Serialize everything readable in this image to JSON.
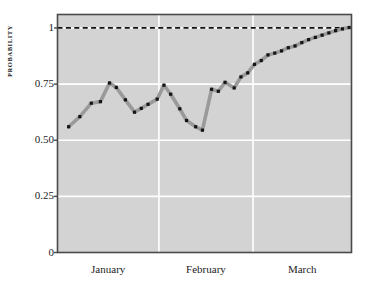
{
  "chart_data": {
    "type": "line",
    "title": "",
    "xlabel": "",
    "ylabel": "PROBABILITY",
    "ylim": [
      0,
      1.06
    ],
    "yticks": [
      0,
      0.25,
      0.5,
      0.75,
      1
    ],
    "ytick_labels": [
      "0",
      "0.25",
      "0.50",
      "0.75",
      "1"
    ],
    "xtick_labels": [
      "January",
      "February",
      "March"
    ],
    "grid": true,
    "grid_color": "#ffffff",
    "plot_bg": "#d3d3d3",
    "page_bg": "#ffffff",
    "line_color": "#9a9a9a",
    "marker_color": "#141414",
    "axis_color": "#4a4a4a",
    "legend": "none",
    "annotations": [
      {
        "type": "hline",
        "y": 1,
        "style": "dashed",
        "color": "#111111",
        "label": ""
      }
    ],
    "month_boundaries": [
      0.345,
      0.665
    ],
    "x": [
      0.038,
      0.076,
      0.115,
      0.146,
      0.177,
      0.2,
      0.231,
      0.262,
      0.285,
      0.308,
      0.339,
      0.362,
      0.385,
      0.416,
      0.439,
      0.47,
      0.493,
      0.524,
      0.547,
      0.57,
      0.601,
      0.624,
      0.647,
      0.67,
      0.693,
      0.716,
      0.739,
      0.762,
      0.785,
      0.808,
      0.831,
      0.854,
      0.877,
      0.9,
      0.923,
      0.946,
      0.969,
      0.992
    ],
    "values": [
      0.56,
      0.605,
      0.665,
      0.672,
      0.755,
      0.735,
      0.68,
      0.625,
      0.642,
      0.66,
      0.683,
      0.745,
      0.705,
      0.64,
      0.588,
      0.56,
      0.545,
      0.727,
      0.718,
      0.758,
      0.733,
      0.782,
      0.8,
      0.838,
      0.855,
      0.88,
      0.888,
      0.898,
      0.912,
      0.92,
      0.935,
      0.948,
      0.958,
      0.968,
      0.978,
      0.988,
      0.996,
      1.002
    ]
  }
}
